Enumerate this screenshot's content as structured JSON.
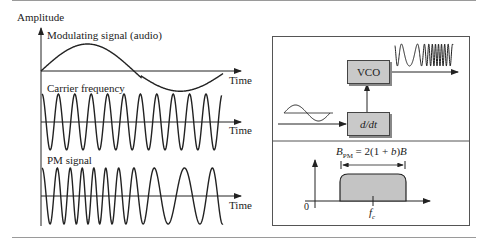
{
  "figure": {
    "left_panel": {
      "y_axis_label": "Amplitude",
      "time_label": "Time",
      "plots": [
        {
          "id": "modulating",
          "title": "Modulating signal (audio)",
          "x_axis_label": "Time",
          "shape": "one-cycle sine (slow)"
        },
        {
          "id": "carrier",
          "title": "Carrier frequency",
          "x_axis_label": "Time",
          "cycles": 11,
          "shape": "constant-frequency sinusoid"
        },
        {
          "id": "pm",
          "title": "PM signal",
          "x_axis_label": "Time",
          "cycles": 11,
          "shape": "phase-modulated sinusoid (compressed at start)"
        }
      ]
    },
    "block_diagram": {
      "blocks": [
        {
          "id": "vco",
          "label": "VCO"
        },
        {
          "id": "derivative",
          "label": "d/dt"
        }
      ],
      "input": "sinusoidal audio signal",
      "output": "frequency-varying waveform"
    },
    "spectrum": {
      "formula_prefix": "B",
      "formula_sub": "PM",
      "formula_rest": " = 2(1 + ",
      "formula_b": "b",
      "formula_close": ")",
      "formula_B": "B",
      "origin_label": "0",
      "center_label": "f",
      "center_sub": "c"
    },
    "colors": {
      "stroke": "#222222",
      "block_fill": "#c9c9c9",
      "band_fill": "#c4c4c4",
      "rule": "#9a9a9a"
    }
  }
}
